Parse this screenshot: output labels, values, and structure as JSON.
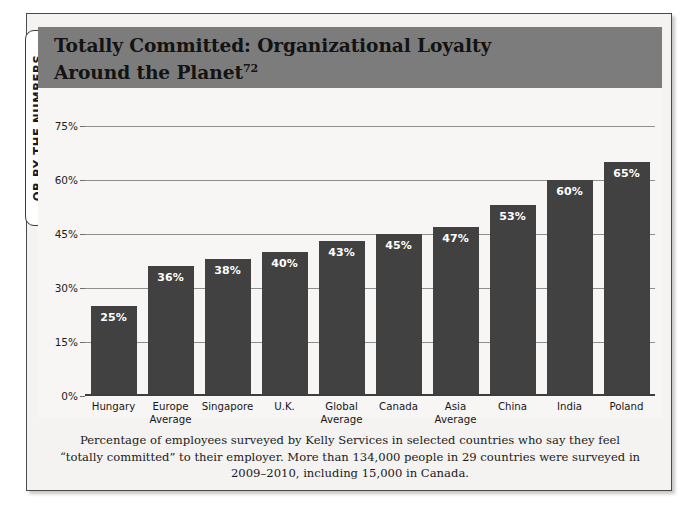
{
  "side_tab": {
    "label": "OB BY THE NUMBERS"
  },
  "header": {
    "title_line1": "Totally Committed: Organizational Loyalty",
    "title_line2": "Around the Planet",
    "title_superscript": "72",
    "band_color": "#7c7c7c"
  },
  "caption": {
    "line1": "Percentage of employees surveyed by Kelly Services in selected countries who say they feel",
    "line2": "“totally committed” to their employer. More than 134,000 people in 29 countries were surveyed",
    "line3": "in 2009–2010, including 15,000 in Canada."
  },
  "chart_data": {
    "type": "bar",
    "title": "Totally Committed: Organizational Loyalty Around the Planet",
    "xlabel": "",
    "ylabel": "",
    "ylim": [
      0,
      75
    ],
    "grid": true,
    "legend": null,
    "bar_color": "#414141",
    "plot_background": "#f7f6f4",
    "ytick_labels": [
      "0%",
      "15%",
      "30%",
      "45%",
      "60%",
      "75%"
    ],
    "ytick_values": [
      0,
      15,
      30,
      45,
      60,
      75
    ],
    "categories": [
      "Hungary",
      "Europe Average",
      "Singapore",
      "U.K.",
      "Global Average",
      "Canada",
      "Asia Average",
      "China",
      "India",
      "Poland"
    ],
    "category_lines": [
      [
        "Hungary"
      ],
      [
        "Europe",
        "Average"
      ],
      [
        "Singapore"
      ],
      [
        "U.K."
      ],
      [
        "Global",
        "Average"
      ],
      [
        "Canada"
      ],
      [
        "Asia",
        "Average"
      ],
      [
        "China"
      ],
      [
        "India"
      ],
      [
        "Poland"
      ]
    ],
    "values": [
      25,
      36,
      38,
      40,
      43,
      45,
      47,
      53,
      60,
      65
    ],
    "value_labels": [
      "25%",
      "36%",
      "38%",
      "40%",
      "43%",
      "45%",
      "47%",
      "53%",
      "60%",
      "65%"
    ]
  }
}
